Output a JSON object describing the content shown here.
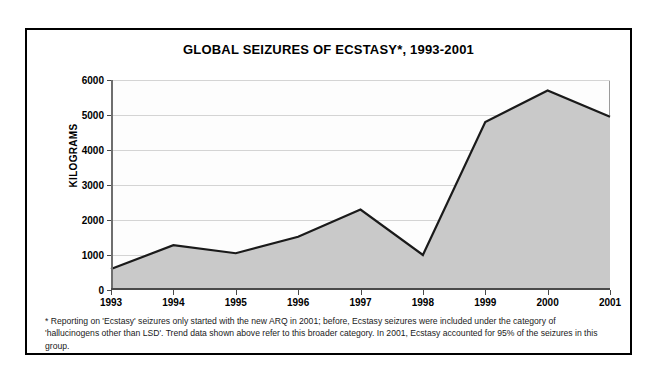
{
  "chart_data": {
    "type": "area",
    "title": "GLOBAL SEIZURES OF ECSTASY*, 1993-2001",
    "xlabel": "",
    "ylabel": "KILOGRAMS",
    "categories": [
      "1993",
      "1994",
      "1995",
      "1996",
      "1997",
      "1998",
      "1999",
      "2000",
      "2001"
    ],
    "values": [
      600,
      1280,
      1050,
      1520,
      2300,
      1000,
      4800,
      5700,
      4950
    ],
    "ylim": [
      0,
      6000
    ],
    "ytick_labels": [
      "0",
      "1000",
      "2000",
      "3000",
      "4000",
      "5000",
      "6000"
    ],
    "ytick_values": [
      0,
      1000,
      2000,
      3000,
      4000,
      5000,
      6000
    ],
    "grid": true,
    "legend": "none",
    "series_fill_color": "#c9c9c9",
    "series_line_color": "#1a1a1a",
    "gridline_color": "#d4d4d4",
    "plot_background": "#fdfdfd",
    "frame_border_color": "#000000"
  },
  "footnote": {
    "text": "* Reporting on 'Ecstasy' seizures only started with the new ARQ in 2001; before, Ecstasy seizures were included under the category of 'hallucinogens other than LSD'. Trend data shown above refer to this broader category. In 2001, Ecstasy accounted for 95% of the seizures in this group."
  }
}
